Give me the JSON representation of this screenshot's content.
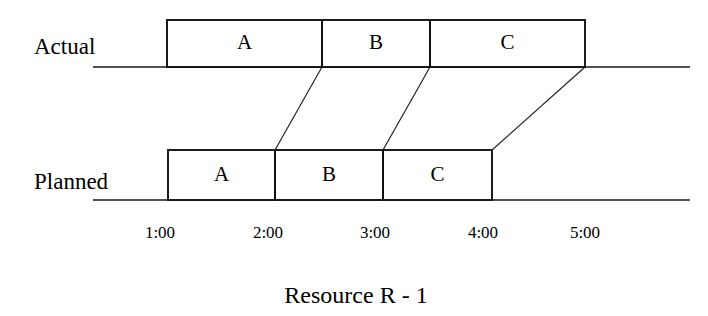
{
  "figure": {
    "caption": "Resource R - 1",
    "caption_x": 356,
    "caption_y": 303
  },
  "rows": [
    {
      "key": "actual",
      "label": "Actual",
      "label_x": 34,
      "label_y": 54,
      "baseline_y": 67,
      "bar_top": 20,
      "bar_bottom": 67,
      "bar_start_x": 167,
      "bar_end_x": 585,
      "tasks": [
        {
          "label": "A",
          "start_x": 167,
          "end_x": 322,
          "start_time": "1:00",
          "end_time": "2:30"
        },
        {
          "label": "B",
          "start_x": 322,
          "end_x": 430,
          "start_time": "2:30",
          "end_time": "3:30"
        },
        {
          "label": "C",
          "start_x": 430,
          "end_x": 585,
          "start_time": "3:30",
          "end_time": "5:00"
        }
      ]
    },
    {
      "key": "planned",
      "label": "Planned",
      "label_x": 34,
      "label_y": 189,
      "baseline_y": 200,
      "bar_top": 150,
      "bar_bottom": 200,
      "bar_start_x": 168,
      "bar_end_x": 492,
      "tasks": [
        {
          "label": "A",
          "start_x": 168,
          "end_x": 275,
          "start_time": "1:00",
          "end_time": "2:00"
        },
        {
          "label": "B",
          "start_x": 275,
          "end_x": 383,
          "start_time": "2:00",
          "end_time": "3:00"
        },
        {
          "label": "C",
          "start_x": 383,
          "end_x": 492,
          "start_time": "3:00",
          "end_time": "4:00"
        }
      ]
    }
  ],
  "baselines": {
    "x_start": 93,
    "x_end": 690
  },
  "connectors": [
    {
      "name": "a-end-connector",
      "actual_x": 322,
      "planned_x": 275
    },
    {
      "name": "b-end-connector",
      "actual_x": 430,
      "planned_x": 383
    },
    {
      "name": "c-end-connector",
      "actual_x": 585,
      "planned_x": 492
    }
  ],
  "time_axis": {
    "label_y": 238,
    "ticks": [
      {
        "label": "1:00",
        "x": 160
      },
      {
        "label": "2:00",
        "x": 268
      },
      {
        "label": "3:00",
        "x": 375
      },
      {
        "label": "4:00",
        "x": 483
      },
      {
        "label": "5:00",
        "x": 585
      }
    ]
  },
  "chart_data": {
    "type": "bar",
    "title": "Resource R - 1",
    "subtitle": "",
    "xlabel": "",
    "ylabel": "",
    "orientation": "horizontal",
    "grid": false,
    "legend": "none",
    "xlim": [
      "1:00",
      "5:00"
    ],
    "categories": [
      "Actual",
      "Planned"
    ],
    "series": [
      {
        "name": "Actual",
        "tasks": [
          {
            "label": "A",
            "start": "1:00",
            "end": "2:30",
            "duration_hours": 1.5
          },
          {
            "label": "B",
            "start": "2:30",
            "end": "3:30",
            "duration_hours": 1.0
          },
          {
            "label": "C",
            "start": "3:30",
            "end": "5:00",
            "duration_hours": 1.5
          }
        ]
      },
      {
        "name": "Planned",
        "tasks": [
          {
            "label": "A",
            "start": "1:00",
            "end": "2:00",
            "duration_hours": 1.0
          },
          {
            "label": "B",
            "start": "2:00",
            "end": "3:00",
            "duration_hours": 1.0
          },
          {
            "label": "C",
            "start": "3:00",
            "end": "4:00",
            "duration_hours": 1.0
          }
        ]
      }
    ],
    "tick_labels": [
      "1:00",
      "2:00",
      "3:00",
      "4:00",
      "5:00"
    ],
    "annotations": [
      "Connector lines link each Actual task boundary to the matching Planned task boundary"
    ]
  }
}
